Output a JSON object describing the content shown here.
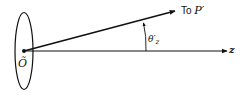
{
  "diagram": {
    "origin_label": "Õ",
    "ray_label_prefix": "To ",
    "ray_label_point": "P′",
    "axis_label": "z",
    "angle_label_symbol": "θ′",
    "angle_label_subscript": "z",
    "colors": {
      "stroke": "#111111",
      "background": "#ffffff"
    },
    "elements": {
      "aperture": "ellipse",
      "ray": "arrow-to-P-prime",
      "axis": "z-axis-arrow",
      "angle_arc": "arc-with-arrowhead"
    }
  }
}
